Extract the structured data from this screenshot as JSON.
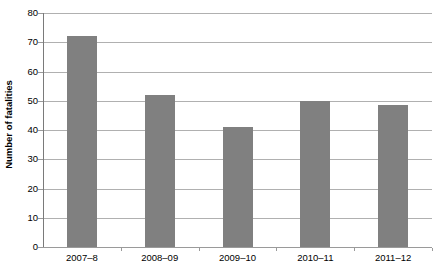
{
  "chart_data": {
    "type": "bar",
    "title": "",
    "subtitle": "",
    "xlabel": "",
    "ylabel": "Number of fatalities",
    "categories": [
      "2007–8",
      "2008–09",
      "2009–10",
      "2010–11",
      "2011–12"
    ],
    "values": [
      72,
      52,
      41,
      50,
      48.5
    ],
    "ylim": [
      0,
      80
    ],
    "yticks": [
      0,
      10,
      20,
      30,
      40,
      50,
      60,
      70,
      80
    ],
    "ytick_labels": [
      "0",
      "10",
      "20",
      "30",
      "40",
      "50",
      "60",
      "70",
      "80"
    ],
    "grid": true,
    "grid_axis": "y",
    "legend": false,
    "legend_position": "none",
    "bar_color": "#808080",
    "gridline_color": "#b0b0b0",
    "axis_color": "#9a9a9a",
    "background_color": "#ffffff",
    "text_color": "#000000",
    "bar_width_px": 30,
    "annotations": []
  }
}
